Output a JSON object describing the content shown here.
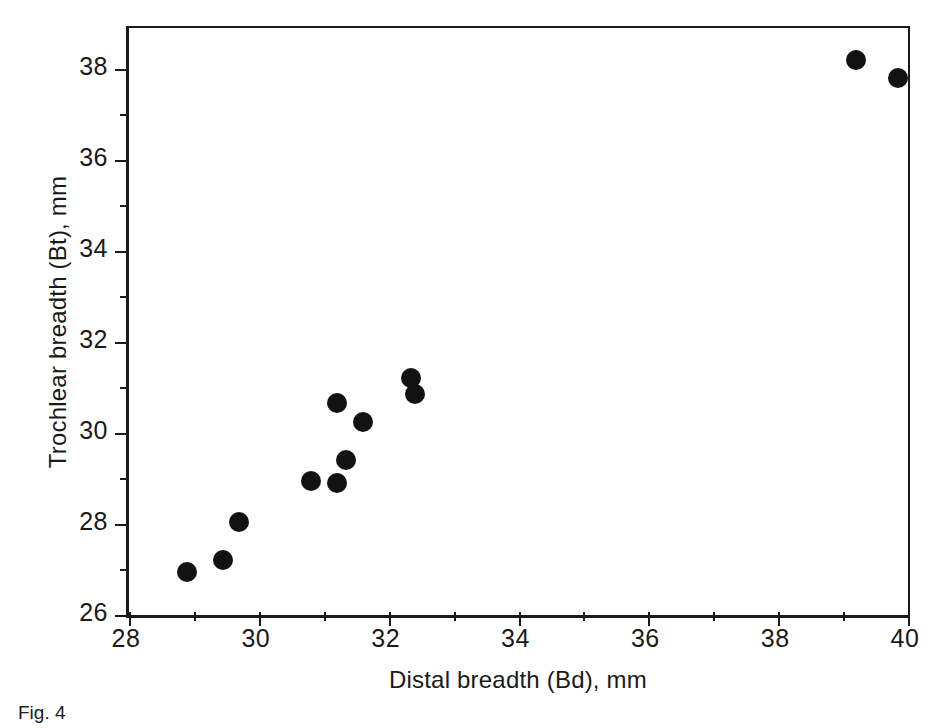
{
  "figure": {
    "caption": "Fig. 4"
  },
  "axes": {
    "x_title": "Distal breadth (Bd), mm",
    "y_title": "Trochlear breadth (Bt), mm",
    "x_ticks": [
      "28",
      "30",
      "32",
      "34",
      "36",
      "38",
      "40"
    ],
    "y_ticks": [
      "26",
      "28",
      "30",
      "32",
      "34",
      "36",
      "38"
    ],
    "frame_color": "#1a1a1a",
    "marker_color": "#121212",
    "background": "#ffffff"
  },
  "chart_data": {
    "type": "scatter",
    "title": "",
    "xlabel": "Distal breadth (Bd), mm",
    "ylabel": "Trochlear breadth (Bt), mm",
    "xlim": [
      28,
      40
    ],
    "ylim": [
      26,
      38.9
    ],
    "xticks": [
      28,
      30,
      32,
      34,
      36,
      38,
      40
    ],
    "yticks": [
      26,
      28,
      30,
      32,
      34,
      36,
      38
    ],
    "x_minor_tick_step": 1,
    "y_minor_tick_step": 1,
    "grid": false,
    "legend": false,
    "marker": "filled-circle",
    "series": [
      {
        "name": "specimens",
        "x": [
          28.9,
          29.45,
          29.7,
          30.8,
          31.2,
          31.2,
          31.35,
          31.6,
          32.35,
          32.4,
          39.2,
          39.85
        ],
        "y": [
          26.95,
          27.2,
          28.05,
          28.95,
          30.65,
          28.9,
          29.4,
          30.25,
          31.2,
          30.85,
          38.2,
          37.8
        ]
      }
    ],
    "points": [
      {
        "x": 28.9,
        "y": 26.95
      },
      {
        "x": 29.45,
        "y": 27.2
      },
      {
        "x": 29.7,
        "y": 28.05
      },
      {
        "x": 30.8,
        "y": 28.95
      },
      {
        "x": 31.2,
        "y": 30.65
      },
      {
        "x": 31.2,
        "y": 28.9
      },
      {
        "x": 31.35,
        "y": 29.4
      },
      {
        "x": 31.6,
        "y": 30.25
      },
      {
        "x": 32.35,
        "y": 31.2
      },
      {
        "x": 32.4,
        "y": 30.85
      },
      {
        "x": 39.2,
        "y": 38.2
      },
      {
        "x": 39.85,
        "y": 37.8
      }
    ]
  }
}
